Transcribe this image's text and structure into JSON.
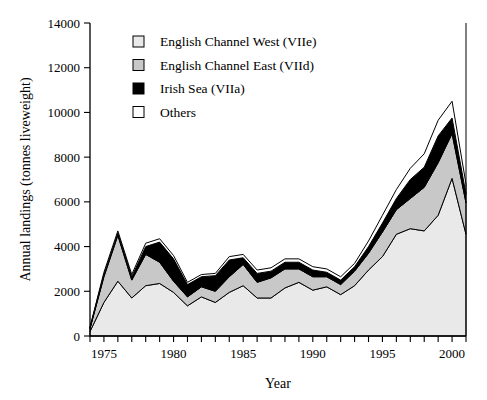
{
  "chart_data": {
    "type": "area",
    "stacked": true,
    "title": "",
    "xlabel": "Year",
    "ylabel": "Annual landings (tonnes liveweight)",
    "xlim": [
      1974,
      2001
    ],
    "ylim": [
      0,
      14000
    ],
    "yticks": [
      0,
      2000,
      4000,
      6000,
      8000,
      10000,
      12000,
      14000
    ],
    "ytick_labels": [
      "0",
      "2000",
      "4000",
      "6000",
      "8000",
      "10000",
      "12000",
      "14000"
    ],
    "xticks": [
      1974,
      1975,
      1976,
      1977,
      1978,
      1979,
      1980,
      1981,
      1982,
      1983,
      1984,
      1985,
      1986,
      1987,
      1988,
      1989,
      1990,
      1991,
      1992,
      1993,
      1994,
      1995,
      1996,
      1997,
      1998,
      1999,
      2000,
      2001
    ],
    "xtick_labels_shown": [
      "1975",
      "1980",
      "1985",
      "1990",
      "1995",
      "2000"
    ],
    "xtick_labels_shown_values": [
      1975,
      1980,
      1985,
      1990,
      1995,
      2000
    ],
    "grid": false,
    "legend_position": "upper-left-inside",
    "x": [
      1974,
      1975,
      1976,
      1977,
      1978,
      1979,
      1980,
      1981,
      1982,
      1983,
      1984,
      1985,
      1986,
      1987,
      1988,
      1989,
      1990,
      1991,
      1992,
      1993,
      1994,
      1995,
      1996,
      1997,
      1998,
      1999,
      2000,
      2001
    ],
    "series": [
      {
        "name": "English Channel West (VIIe)",
        "color": "#e9e9e9",
        "values": [
          200,
          1500,
          2450,
          1700,
          2250,
          2350,
          1950,
          1350,
          1750,
          1500,
          1950,
          2250,
          1700,
          1700,
          2150,
          2400,
          2050,
          2200,
          1850,
          2250,
          2950,
          3550,
          4550,
          4800,
          4700,
          5400,
          7050,
          4550
        ]
      },
      {
        "name": "English Channel East (VIId)",
        "color": "#c8c8c8",
        "values": [
          130,
          1150,
          2050,
          800,
          1400,
          950,
          500,
          400,
          450,
          500,
          700,
          950,
          700,
          900,
          850,
          600,
          600,
          450,
          450,
          650,
          750,
          1100,
          1100,
          1350,
          1950,
          2350,
          2000,
          1400
        ]
      },
      {
        "name": "Irish Sea (VIIa)",
        "color": "#000000",
        "values": [
          40,
          100,
          100,
          150,
          350,
          900,
          1000,
          550,
          450,
          700,
          750,
          300,
          400,
          300,
          300,
          300,
          300,
          200,
          200,
          200,
          300,
          400,
          500,
          850,
          900,
          1200,
          700,
          400
        ]
      },
      {
        "name": "Others",
        "color": "#ffffff",
        "values": [
          30,
          100,
          100,
          100,
          150,
          150,
          150,
          100,
          100,
          100,
          150,
          150,
          150,
          150,
          150,
          150,
          150,
          150,
          150,
          150,
          250,
          350,
          400,
          500,
          600,
          700,
          750,
          450
        ]
      }
    ]
  },
  "legend": {
    "items": [
      {
        "label": "English Channel West (VIIe)",
        "swatch_color": "#e9e9e9"
      },
      {
        "label": "English Channel East (VIId)",
        "swatch_color": "#c8c8c8"
      },
      {
        "label": "Irish Sea (VIIa)",
        "swatch_color": "#000000"
      },
      {
        "label": "Others",
        "swatch_color": "#ffffff"
      }
    ]
  },
  "axes": {
    "x_title": "Year",
    "y_title": "Annual landings (tonnes liveweight)"
  }
}
